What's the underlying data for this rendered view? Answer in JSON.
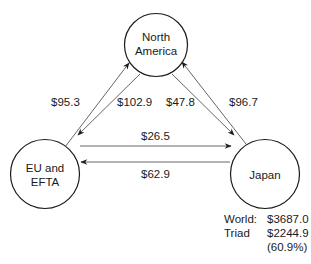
{
  "diagram": {
    "type": "trade-flow",
    "nodes": [
      {
        "id": "na",
        "label_line1": "North",
        "label_line2": "America"
      },
      {
        "id": "eu",
        "label_line1": "EU and",
        "label_line2": "EFTA"
      },
      {
        "id": "jp",
        "label_line1": "Japan",
        "label_line2": ""
      }
    ],
    "flows": [
      {
        "from": "eu",
        "to": "na",
        "value": "$95.3"
      },
      {
        "from": "na",
        "to": "eu",
        "value": "$102.9"
      },
      {
        "from": "na",
        "to": "jp",
        "value": "$47.8"
      },
      {
        "from": "jp",
        "to": "na",
        "value": "$96.7"
      },
      {
        "from": "eu",
        "to": "jp",
        "value": "$26.5"
      },
      {
        "from": "jp",
        "to": "eu",
        "value": "$62.9"
      }
    ],
    "totals": {
      "world_label": "World:",
      "world_value": "$3687.0",
      "triad_label": "Triad",
      "triad_value": "$2244.9",
      "triad_share": "(60.9%)"
    }
  },
  "colors": {
    "stroke": "#1a1a1a",
    "arrow_line": "#555555"
  }
}
